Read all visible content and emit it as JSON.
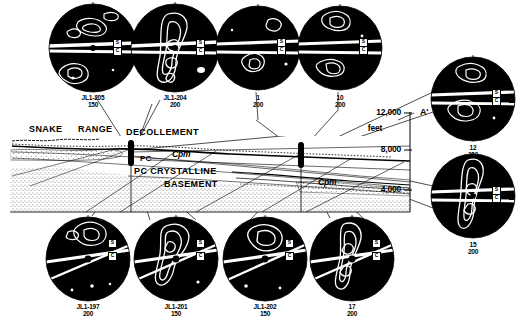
{
  "figure": {
    "caption_text": "",
    "background": "#ffffff",
    "ink": "#000000"
  },
  "cross_section": {
    "labels": {
      "snake": "SNAKE",
      "range": "RANGE",
      "decollement": "DECOLLEMENT",
      "pc": "PC",
      "cpm_upper": "Cpm",
      "cpm_lower": "Cpm",
      "basement_line1": "PC CRYSTALLINE",
      "basement_line2": "BASEMENT",
      "end_point": "A'"
    },
    "scale": {
      "units": "feet",
      "ticks": [
        "12,000",
        "8,000",
        "4,000"
      ]
    }
  },
  "stereonets": [
    {
      "id": "net-jl1-205",
      "sample": "JL1-205",
      "count": "150",
      "s_label": "S",
      "c_label": "C"
    },
    {
      "id": "net-jl1-204",
      "sample": "JL1-204",
      "count": "200",
      "s_label": "S",
      "c_label": "C"
    },
    {
      "id": "net-1",
      "sample": "1",
      "count": "200",
      "s_label": "S",
      "c_label": "C"
    },
    {
      "id": "net-10",
      "sample": "10",
      "count": "200",
      "s_label": "S",
      "c_label": "C"
    },
    {
      "id": "net-12",
      "sample": "12",
      "count": "200",
      "s_label": "S",
      "c_label": "C"
    },
    {
      "id": "net-15",
      "sample": "15",
      "count": "200",
      "s_label": "S",
      "c_label": "C"
    },
    {
      "id": "net-jl1-197",
      "sample": "JL1-197",
      "count": "200",
      "s_label": "S",
      "c_label": "C"
    },
    {
      "id": "net-jl1-201",
      "sample": "JL1-201",
      "count": "150",
      "s_label": "S",
      "c_label": "C"
    },
    {
      "id": "net-jl1-202",
      "sample": "JL1-202",
      "count": "150",
      "s_label": "S",
      "c_label": "C"
    },
    {
      "id": "net-17",
      "sample": "17",
      "count": "200",
      "s_label": "S",
      "c_label": "C"
    }
  ]
}
